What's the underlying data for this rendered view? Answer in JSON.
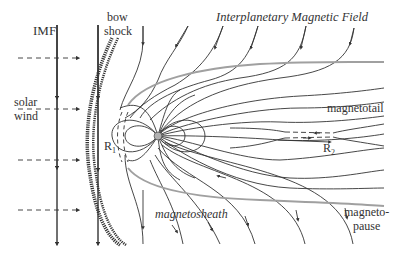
{
  "diagram": {
    "title": "Interplanetary Magnetic Field",
    "labels": {
      "imf": "IMF",
      "bow_shock_1": "bow",
      "bow_shock_2": "shock",
      "solar_wind_1": "solar",
      "solar_wind_2": "wind",
      "magnetotail": "magnetotail",
      "magnetosheath": "magnetosheath",
      "magnetopause_1": "magneto-",
      "magnetopause_2": "pause",
      "r1_main": "R",
      "r1_sub": "1",
      "r2_main": "R",
      "r2_sub": "2"
    },
    "colors": {
      "field_line": "#333333",
      "magnetopause": "#a0a0a0",
      "earth": "#b0b0b0",
      "background": "#ffffff"
    },
    "elements": [
      "IMF vertical field lines (southward)",
      "solar wind dashed arrows (4)",
      "bow shock (hatched arc)",
      "magnetopause (gray boundary)",
      "Earth dipole with closed loops",
      "dayside reconnection point R1",
      "nightside reconnection point R2",
      "magnetotail lobes"
    ]
  }
}
